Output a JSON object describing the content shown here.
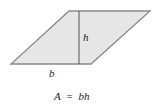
{
  "diagram": {
    "shape": "parallelogram",
    "fill_color": "#e6e6e6",
    "stroke_color": "#8a8a8a",
    "height_line_color": "#555555",
    "vertices": [
      [
        69,
        11
      ],
      [
        150,
        11
      ],
      [
        91,
        64
      ],
      [
        11,
        64
      ]
    ],
    "height_line": {
      "x": 79,
      "y1": 11,
      "y2": 64
    },
    "labels": {
      "height": "h",
      "base": "b"
    },
    "formula": {
      "lhs": "A",
      "eq": "=",
      "rhs": "bh"
    }
  }
}
